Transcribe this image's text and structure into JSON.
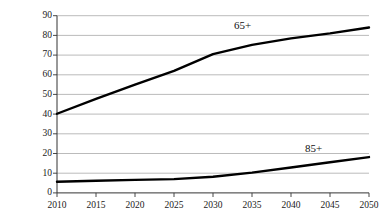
{
  "chart_data": {
    "type": "line",
    "title": "",
    "xlabel": "",
    "ylabel": "Millions",
    "x": [
      2010,
      2015,
      2020,
      2025,
      2030,
      2035,
      2040,
      2045,
      2050
    ],
    "xtick_labels": [
      "2010",
      "2015",
      "2020",
      "2025",
      "2030",
      "2035",
      "2040",
      "2045",
      "2050"
    ],
    "ytick_labels": [
      "0",
      "10",
      "20",
      "30",
      "40",
      "50",
      "60",
      "70",
      "80",
      "90"
    ],
    "yticks": [
      0,
      10,
      20,
      30,
      40,
      50,
      60,
      70,
      80,
      90
    ],
    "ylim": [
      0,
      90
    ],
    "xlim": [
      2010,
      2050
    ],
    "grid": "horizontal",
    "legend": "inline-labels",
    "series": [
      {
        "name": "65+",
        "label": "65+",
        "color": "#000000",
        "values": [
          40.2,
          47.7,
          55.0,
          62.0,
          70.5,
          75.2,
          78.5,
          81.0,
          84.0
        ]
      },
      {
        "name": "85+",
        "label": "85+",
        "color": "#000000",
        "values": [
          5.7,
          6.2,
          6.6,
          7.0,
          8.2,
          10.3,
          12.9,
          15.6,
          18.2
        ]
      }
    ],
    "annotations": [
      {
        "text": "65+",
        "x": 2032,
        "y": 87.5
      },
      {
        "text": "85+",
        "x": 2041.5,
        "y": 22.5
      }
    ]
  },
  "axes": {
    "y_title": "Millions"
  }
}
